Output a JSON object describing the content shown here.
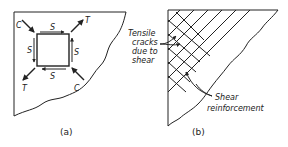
{
  "panels": [
    {
      "id": "a",
      "caption": "(a)",
      "element_labels": {
        "top": "S",
        "left": "S",
        "right": "S",
        "bottom": "S",
        "top_left": "C",
        "top_right": "T",
        "bottom_left": "T",
        "bottom_right": "C"
      }
    },
    {
      "id": "b",
      "caption": "(b)",
      "annotations": {
        "cracks_line1": "Tensile",
        "cracks_line2": "cracks",
        "cracks_line3": "due to",
        "cracks_line4": "shear",
        "reinf_line1": "Shear",
        "reinf_line2": "reinforcement"
      }
    }
  ],
  "colors": {
    "ink": "#222222",
    "background": "#ffffff"
  }
}
